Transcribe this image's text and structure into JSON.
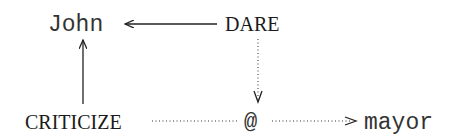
{
  "diagram": {
    "nodes": {
      "john": {
        "label": "John",
        "style": "monospace"
      },
      "dare": {
        "label": "DARE",
        "style": "small-caps-serif"
      },
      "criticize": {
        "label": "CRITICIZE",
        "style": "small-caps-serif"
      },
      "at": {
        "label": "@",
        "style": "monospace"
      },
      "mayor": {
        "label": "mayor",
        "style": "monospace"
      }
    },
    "edges": [
      {
        "from": "DARE",
        "to": "John",
        "line": "solid"
      },
      {
        "from": "CRITICIZE",
        "to": "John",
        "line": "solid"
      },
      {
        "from": "DARE",
        "to": "@",
        "line": "dotted"
      },
      {
        "from": "CRITICIZE",
        "to": "@",
        "line": "dotted",
        "arrowhead": false
      },
      {
        "from": "@",
        "to": "mayor",
        "line": "dotted"
      }
    ],
    "colors": {
      "line": "#222222",
      "text": "#222222",
      "background": "#ffffff"
    }
  }
}
